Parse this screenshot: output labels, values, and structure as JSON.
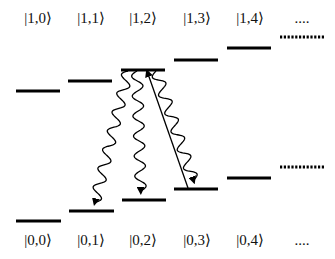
{
  "diagram": {
    "type": "energy-level-diagram",
    "colors": {
      "line": "#000000",
      "background": "#ffffff",
      "text": "#111111"
    },
    "upper_labels": [
      {
        "text": "|1,0⟩",
        "x": 38
      },
      {
        "text": "|1,1⟩",
        "x": 91
      },
      {
        "text": "|1,2⟩",
        "x": 143
      },
      {
        "text": "|1,3⟩",
        "x": 197
      },
      {
        "text": "|1,4⟩",
        "x": 250
      },
      {
        "text": "....",
        "x": 302
      }
    ],
    "lower_labels": [
      {
        "text": "|0,0⟩",
        "x": 38
      },
      {
        "text": "|0,1⟩",
        "x": 91
      },
      {
        "text": "|0,2⟩",
        "x": 143
      },
      {
        "text": "|0,3⟩",
        "x": 197
      },
      {
        "text": "|0,4⟩",
        "x": 250
      },
      {
        "text": "....",
        "x": 302
      }
    ],
    "upper_levels": [
      {
        "state": "|1,0>",
        "x1": 16,
        "x2": 60,
        "y": 91
      },
      {
        "state": "|1,1>",
        "x1": 68,
        "x2": 112,
        "y": 81
      },
      {
        "state": "|1,2>",
        "x1": 121,
        "x2": 165,
        "y": 70
      },
      {
        "state": "|1,3>",
        "x1": 174,
        "x2": 218,
        "y": 60
      },
      {
        "state": "|1,4>",
        "x1": 227,
        "x2": 271,
        "y": 48
      },
      {
        "state": "...",
        "x1": 280,
        "x2": 325,
        "y": 37,
        "dotted": true
      }
    ],
    "lower_levels": [
      {
        "state": "|0,0>",
        "x1": 16,
        "x2": 61,
        "y": 221
      },
      {
        "state": "|0,1>",
        "x1": 69,
        "x2": 114,
        "y": 211
      },
      {
        "state": "|0,2>",
        "x1": 122,
        "x2": 166,
        "y": 200
      },
      {
        "state": "|0,3>",
        "x1": 174,
        "x2": 218,
        "y": 189
      },
      {
        "state": "|0,4>",
        "x1": 227,
        "x2": 271,
        "y": 178
      },
      {
        "state": "...",
        "x1": 280,
        "x2": 325,
        "y": 167,
        "dotted": true
      }
    ],
    "transitions": [
      {
        "kind": "wavy-emission",
        "from": "|1,2>",
        "to": "|0,1>",
        "x_from": 128,
        "y_from": 71,
        "x_to": 93,
        "y_to": 210
      },
      {
        "kind": "wavy-emission",
        "from": "|1,2>",
        "to": "|0,2>",
        "x_from": 137,
        "y_from": 71,
        "x_to": 141,
        "y_to": 199
      },
      {
        "kind": "straight-excitation",
        "from": "|0,3>",
        "to": "|1,2>",
        "x_from": 188,
        "y_from": 188,
        "x_to": 147,
        "y_to": 71
      },
      {
        "kind": "wavy-emission",
        "from": "|1,2>",
        "to": "|0,3>",
        "x_from": 156,
        "y_from": 71,
        "x_to": 196,
        "y_to": 188
      }
    ]
  }
}
